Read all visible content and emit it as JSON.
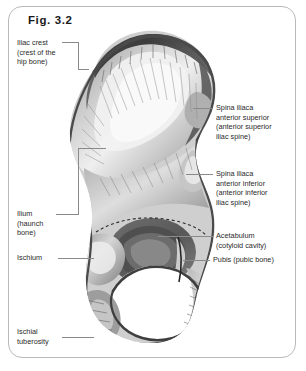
{
  "figure": {
    "title": "Fig. 3.2",
    "frame_color": "#b9b9b9",
    "text_color": "#2a2a2a",
    "leader_color": "#8a8a8a",
    "background": "#ffffff"
  },
  "labels": {
    "iliac_crest": "Iliac crest\n(crest of the\nhip bone)",
    "ilium": "Ilium\n(haunch\nbone)",
    "ischium": "Ischium",
    "ischial_tuberosity": "Ischial\ntuberosity",
    "spina_iliaca_anterior_superior": "Spina iliaca\nanterior superior\n(anterior superior\niliac spine)",
    "spina_iliaca_anterior_inferior": "Spina iliaca\nanterior inferior\n(anterior inferior\niliac spine)",
    "acetabulum": "Acetabulum\n(cotyloid cavity)",
    "pubis": "Pubis (pubic bone)"
  }
}
